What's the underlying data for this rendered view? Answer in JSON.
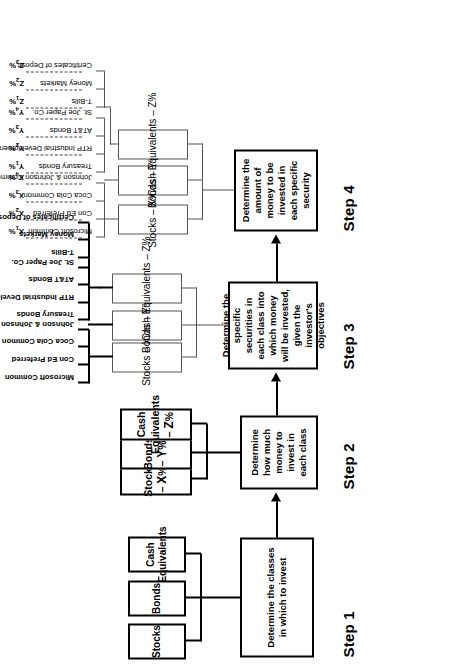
{
  "diagram": {
    "steps": [
      {
        "id": "step1",
        "label": "Step 1",
        "text": "Determine the classes in which to invest"
      },
      {
        "id": "step2",
        "label": "Step 2",
        "text": "Determine how much money to invest in each class"
      },
      {
        "id": "step3",
        "label": "Step 3",
        "text": "Determine the specific securities in each class into which money will be invested, given the investor's objectives"
      },
      {
        "id": "step4",
        "label": "Step 4",
        "text": "Determine the amount of money to be invested in each specific security"
      }
    ],
    "step1_classes": [
      {
        "label": "Stocks"
      },
      {
        "label": "Bonds"
      },
      {
        "label": "Cash Equivalents"
      }
    ],
    "step2_classes": [
      {
        "name": "Stocks",
        "pct": "X",
        "label": "Stocks – X%"
      },
      {
        "name": "Bonds",
        "pct": "Y",
        "label": "Bonds – Y%"
      },
      {
        "name": "Cash Equivalents",
        "pct": "Z",
        "label": "Cash Equivalents – Z%"
      }
    ],
    "step3_classes": [
      {
        "label": "Stocks – X%",
        "securities": [
          "Microsoft Common",
          "Con Ed Preferred",
          "Coca Cola Common",
          "Johnson & Johnson Common"
        ]
      },
      {
        "label": "Bonds – Y%",
        "securities": [
          "Treasury Bonds",
          "RTP Industrial Development",
          "AT&T Bonds",
          "St. Joe Paper Co."
        ]
      },
      {
        "label": "Cash Equivalents – Z%",
        "securities": [
          "T-Bills",
          "Money Markets",
          "Certificates of Deposit"
        ]
      }
    ],
    "step4_classes": [
      {
        "label": "Stocks – X%",
        "securities": [
          {
            "name": "Microsoft Common",
            "pct": "X",
            "sub": "1",
            "pct_label": "X1%"
          },
          {
            "name": "Con Ed Preferred",
            "pct": "X",
            "sub": "2",
            "pct_label": "X2%"
          },
          {
            "name": "Coca Cola Common",
            "pct": "X",
            "sub": "3",
            "pct_label": "X3%"
          },
          {
            "name": "Johnson & Johnson Common",
            "pct": "X",
            "sub": "4",
            "pct_label": "X4%"
          }
        ]
      },
      {
        "label": "Bonds – Y%",
        "securities": [
          {
            "name": "Treasury Bonds",
            "pct": "Y",
            "sub": "1",
            "pct_label": "Y1%"
          },
          {
            "name": "RTP Industrial Development",
            "pct": "Y",
            "sub": "2",
            "pct_label": "Y2%"
          },
          {
            "name": "AT&T Bonds",
            "pct": "Y",
            "sub": "3",
            "pct_label": "Y3%"
          },
          {
            "name": "St. Joe Paper Co.",
            "pct": "Y",
            "sub": "4",
            "pct_label": "Y4%"
          }
        ]
      },
      {
        "label": "Cash Equivalents – Z%",
        "securities": [
          {
            "name": "T-Bills",
            "pct": "Z",
            "sub": "1",
            "pct_label": "Z1%"
          },
          {
            "name": "Money Markets",
            "pct": "Z",
            "sub": "2",
            "pct_label": "Z2%"
          },
          {
            "name": "Certificates of Deposit",
            "pct": "Z",
            "sub": "3",
            "pct_label": "Z3%"
          }
        ]
      }
    ],
    "colors": {
      "ink": "#000000",
      "light_rule": "#555555",
      "paper": "#ffffff"
    }
  }
}
